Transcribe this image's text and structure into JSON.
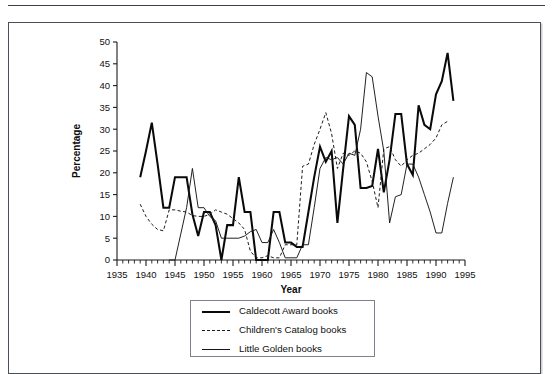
{
  "figure": {
    "frame_border_color": "#4a4f59",
    "background": "#ffffff"
  },
  "chart_data": {
    "type": "line",
    "title": "",
    "xlabel": "Year",
    "ylabel": "Percentage",
    "xlim": [
      1935,
      1995
    ],
    "ylim": [
      0,
      50
    ],
    "xticks": [
      1935,
      1940,
      1945,
      1950,
      1955,
      1960,
      1965,
      1970,
      1975,
      1980,
      1985,
      1990,
      1995
    ],
    "yticks": [
      0,
      5,
      10,
      15,
      20,
      25,
      30,
      35,
      40,
      45,
      50
    ],
    "xtick_labels": [
      "1935",
      "1940",
      "1945",
      "1950",
      "1955",
      "1960",
      "1965",
      "1970",
      "1975",
      "1980",
      "1985",
      "1990",
      "1995"
    ],
    "ytick_labels": [
      "0",
      "5",
      "10",
      "15",
      "20",
      "25",
      "30",
      "35",
      "40",
      "45",
      "50"
    ],
    "minor_xtick_interval": 1,
    "grid": false,
    "legend_position": "below-plot",
    "series": [
      {
        "name": "Caldecott Award books",
        "style": "solid-thick",
        "color": "#0a0a0a",
        "x": [
          1939,
          1940,
          1941,
          1942,
          1943,
          1944,
          1945,
          1946,
          1947,
          1948,
          1949,
          1950,
          1951,
          1952,
          1953,
          1954,
          1955,
          1956,
          1957,
          1958,
          1959,
          1960,
          1961,
          1962,
          1963,
          1964,
          1965,
          1966,
          1967,
          1968,
          1969,
          1970,
          1971,
          1972,
          1973,
          1974,
          1975,
          1976,
          1977,
          1978,
          1979,
          1980,
          1981,
          1982,
          1983,
          1984,
          1985,
          1986,
          1987,
          1988,
          1989,
          1990,
          1991,
          1992,
          1993
        ],
        "values": [
          19,
          25,
          31.5,
          22,
          12,
          12,
          19,
          19,
          19,
          10.5,
          5.5,
          11,
          11,
          8,
          0,
          8,
          8,
          19,
          11,
          11,
          0,
          0,
          0,
          11,
          11,
          4,
          4,
          3,
          3,
          11,
          19,
          26,
          22.5,
          25,
          8.5,
          21,
          33,
          31,
          16.5,
          16.5,
          17,
          25.5,
          15.5,
          23,
          33.5,
          33.5,
          22,
          19.5,
          35.5,
          31,
          30,
          38,
          41,
          47.5,
          36.5
        ]
      },
      {
        "name": "Children's Catalog books",
        "style": "dashed",
        "color": "#1c1c1c",
        "x": [
          1939,
          1940,
          1941,
          1942,
          1943,
          1944,
          1945,
          1946,
          1947,
          1948,
          1949,
          1950,
          1951,
          1952,
          1953,
          1954,
          1955,
          1956,
          1957,
          1958,
          1959,
          1960,
          1961,
          1962,
          1963,
          1964,
          1965,
          1966,
          1967,
          1968,
          1969,
          1970,
          1971,
          1972,
          1973,
          1974,
          1975,
          1976,
          1977,
          1978,
          1979,
          1980,
          1981,
          1982,
          1983,
          1984,
          1985,
          1986,
          1987,
          1988,
          1989,
          1990,
          1991,
          1992
        ],
        "values": [
          12.8,
          10,
          8.2,
          7,
          6.7,
          11.5,
          11.5,
          11.2,
          11,
          10.2,
          10,
          10,
          10.5,
          11.5,
          11,
          10.5,
          9.5,
          8.5,
          7,
          2,
          0.5,
          0.5,
          1,
          0.5,
          0.5,
          3.5,
          3.5,
          3.5,
          21.5,
          22,
          26.5,
          30,
          33.8,
          29,
          21,
          24.5,
          24,
          25,
          24.5,
          22.5,
          18,
          12,
          25.5,
          26,
          23,
          21.5,
          23,
          24,
          24.5,
          25.5,
          26.5,
          28,
          31,
          31.8
        ]
      },
      {
        "name": "Little Golden books",
        "style": "solid-thin",
        "color": "#151515",
        "x": [
          1944,
          1945,
          1946,
          1947,
          1948,
          1949,
          1950,
          1951,
          1952,
          1953,
          1954,
          1955,
          1956,
          1957,
          1958,
          1959,
          1960,
          1961,
          1962,
          1963,
          1964,
          1965,
          1966,
          1967,
          1968,
          1969,
          1970,
          1971,
          1972,
          1973,
          1974,
          1975,
          1976,
          1977,
          1978,
          1979,
          1980,
          1981,
          1982,
          1983,
          1984,
          1985,
          1986,
          1987,
          1988,
          1989,
          1990,
          1991,
          1992,
          1993
        ],
        "values": [
          0,
          0,
          6,
          12,
          21,
          12,
          12,
          10,
          9,
          5,
          5,
          5,
          5,
          5.5,
          6.5,
          7,
          4,
          4,
          7,
          4,
          0.5,
          0.5,
          0.5,
          3.5,
          3.5,
          12,
          21,
          23.5,
          23,
          23.5,
          22,
          24.5,
          24,
          30,
          43,
          42,
          33,
          25,
          8.5,
          14.5,
          15,
          22,
          22,
          19,
          15,
          11,
          6.2,
          6.2,
          13,
          19
        ]
      }
    ]
  },
  "legend": {
    "items": [
      {
        "label": "Caldecott Award books",
        "style": "solid-thick"
      },
      {
        "label": "Children's Catalog books",
        "style": "dashed"
      },
      {
        "label": "Little Golden books",
        "style": "solid-thin"
      }
    ]
  }
}
